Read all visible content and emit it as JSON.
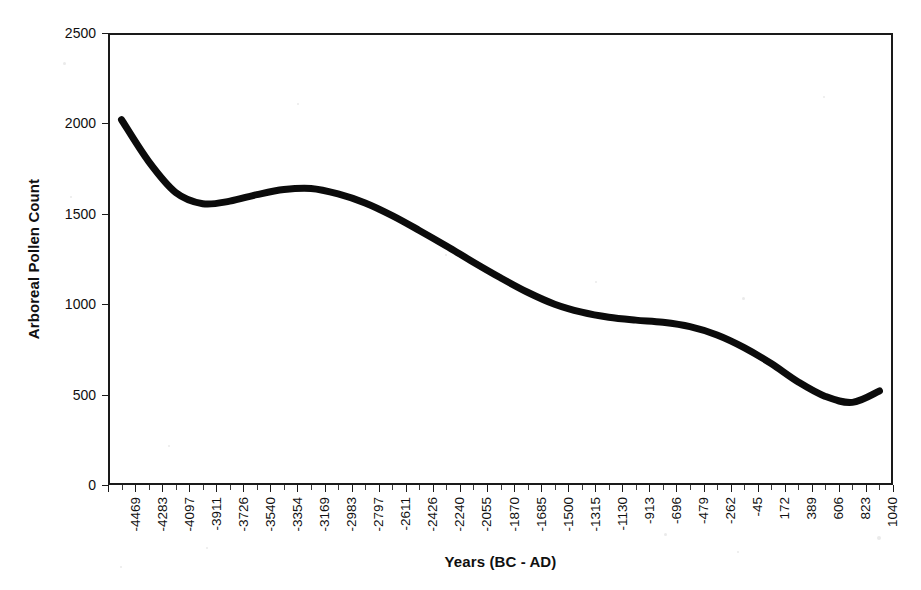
{
  "chart_data": {
    "type": "line",
    "title": "",
    "xlabel": "Years (BC - AD)",
    "ylabel": "Arboreal Pollen Count",
    "ylim": [
      0,
      2500
    ],
    "y_ticks": [
      0,
      500,
      1000,
      1500,
      2000,
      2500
    ],
    "grid": false,
    "legend": "none",
    "categories": [
      "-4469",
      "-4283",
      "-4097",
      "-3911",
      "-3726",
      "-3540",
      "-3354",
      "-3169",
      "-2983",
      "-2797",
      "-2611",
      "-2426",
      "-2240",
      "-2055",
      "-1870",
      "-1685",
      "-1500",
      "-1315",
      "-1130",
      "-913",
      "-696",
      "-479",
      "-262",
      "-45",
      "172",
      "389",
      "606",
      "823",
      "1040"
    ],
    "series": [
      {
        "name": "Arboreal Pollen Count",
        "values": [
          2020,
          1790,
          1618,
          1556,
          1570,
          1606,
          1634,
          1640,
          1610,
          1560,
          1490,
          1408,
          1322,
          1232,
          1146,
          1066,
          1000,
          956,
          928,
          912,
          900,
          876,
          830,
          760,
          672,
          570,
          490,
          457,
          520
        ]
      }
    ],
    "notes": {
      "start_value": 2020,
      "local_minimum_early": 1556,
      "local_maximum": 1640,
      "global_minimum": 455,
      "end_value": 648,
      "line_color": "#0b0b0b",
      "background_color": "#ffffff",
      "frame_color": "#1a1a1a"
    }
  },
  "axes": {
    "x_title": "Years (BC - AD)",
    "y_title": "Arboreal Pollen Count"
  }
}
